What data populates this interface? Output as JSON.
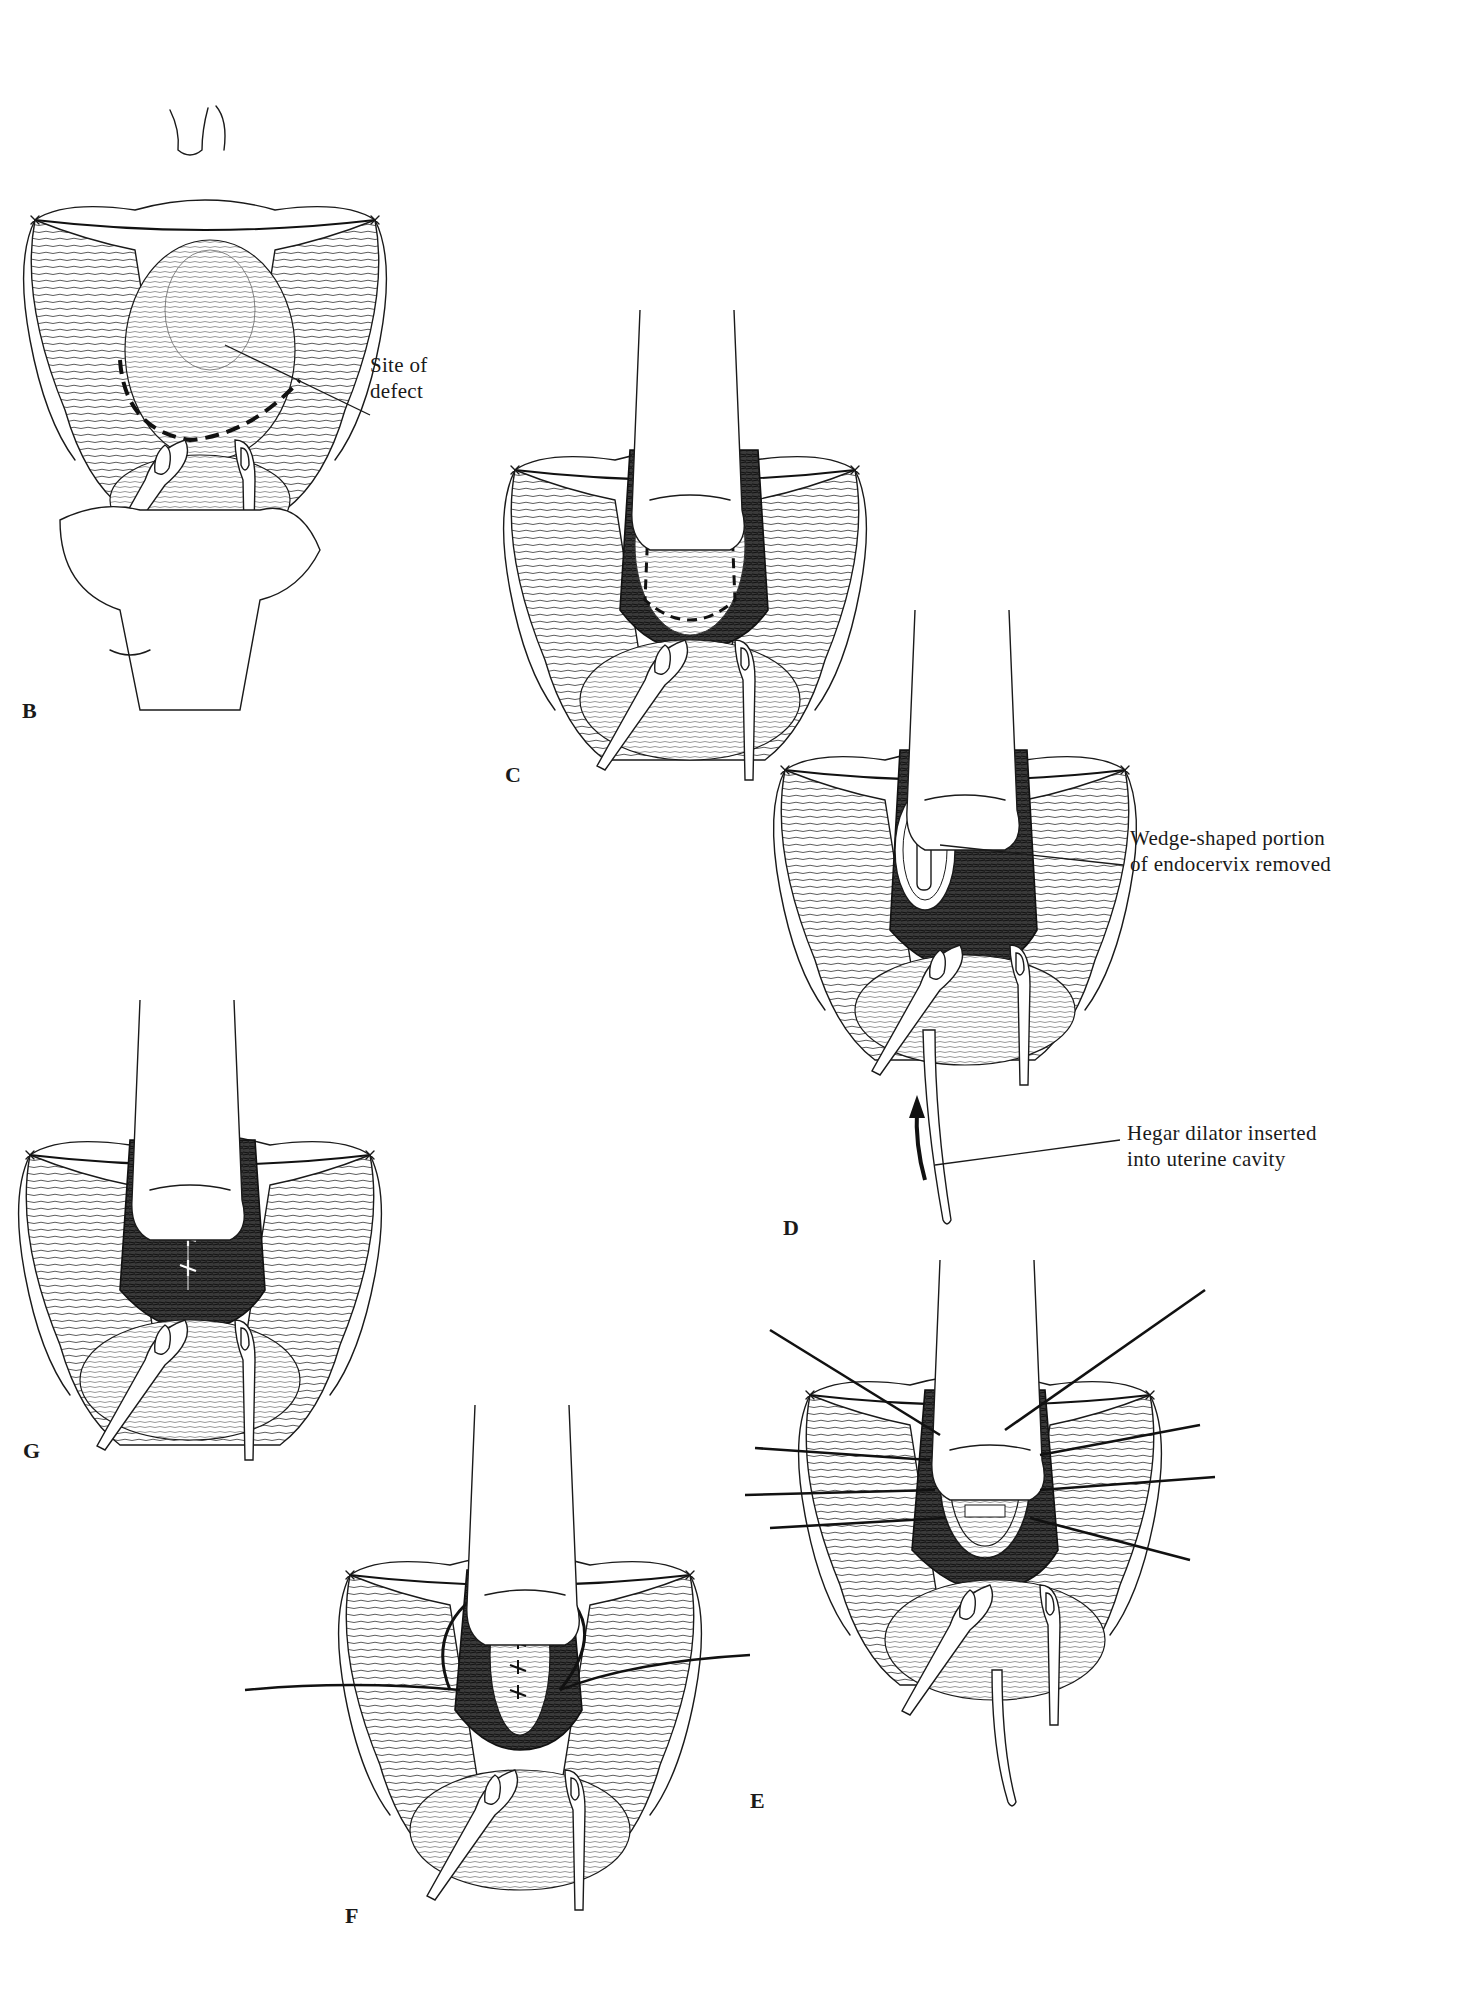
{
  "figure": {
    "panels": [
      {
        "id": "B",
        "letter": "B",
        "callouts": [
          {
            "lines": [
              "Site of",
              "defect"
            ]
          }
        ]
      },
      {
        "id": "C",
        "letter": "C",
        "callouts": []
      },
      {
        "id": "D",
        "letter": "D",
        "callouts": [
          {
            "lines": [
              "Wedge-shaped portion",
              "of endocervix removed"
            ]
          },
          {
            "lines": [
              "Hegar dilator inserted",
              "into uterine cavity"
            ]
          }
        ]
      },
      {
        "id": "E",
        "letter": "E",
        "callouts": []
      },
      {
        "id": "F",
        "letter": "F",
        "callouts": []
      },
      {
        "id": "G",
        "letter": "G",
        "callouts": []
      }
    ]
  },
  "colors": {
    "ink": "#1a1a1a",
    "background": "#ffffff",
    "tissue_dark": "#2a2a2a"
  }
}
